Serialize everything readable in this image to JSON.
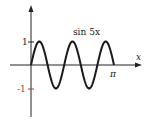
{
  "chart_data": {
    "type": "line",
    "title": "",
    "series": [
      {
        "name": "sin 5x",
        "function": "sin(5x)",
        "x": [
          0,
          0.314,
          0.628,
          0.942,
          1.257,
          1.571,
          1.885,
          2.199,
          2.513,
          2.827,
          3.142
        ],
        "values": [
          0,
          1,
          0,
          -1,
          0,
          1,
          0,
          -1,
          0,
          1,
          0
        ]
      }
    ],
    "xlabel": "x",
    "ylabel": "",
    "xlim": [
      0,
      3.1416
    ],
    "ylim": [
      -1,
      1
    ],
    "x_ticks": [
      {
        "value": 3.1416,
        "label": "π"
      }
    ],
    "y_ticks": [
      {
        "value": 1,
        "label": "1"
      },
      {
        "value": -1,
        "label": "-1"
      }
    ],
    "grid": false,
    "legend": "none",
    "annotations": [
      {
        "text": "sin 5x",
        "position": "above curve, center-right"
      }
    ]
  },
  "labels": {
    "curve_label": "sin 5x",
    "x_axis_label": "x",
    "x_tick_pi": "π",
    "y_tick_one": "1",
    "y_tick_neg_one": "-1"
  },
  "colors": {
    "curve": "#1a1a1a",
    "axis": "#222222",
    "neg_tick": "#b03a2e"
  }
}
